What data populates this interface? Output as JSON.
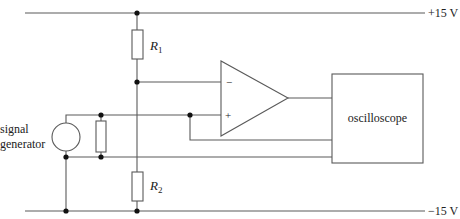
{
  "diagram": {
    "type": "circuit-schematic",
    "rails": {
      "positive": "+15 V",
      "negative": "−15 V"
    },
    "components": {
      "r1": {
        "symbol": "R",
        "subscript": "1"
      },
      "r2": {
        "symbol": "R",
        "subscript": "2"
      },
      "op_amp": {
        "inverting": "−",
        "non_inverting": "+"
      },
      "oscilloscope": {
        "label": "oscilloscope"
      },
      "signal_generator": {
        "line1": "signal",
        "line2": "generator"
      }
    },
    "colors": {
      "wire": "#5a5a5a",
      "junction": "#111111",
      "text": "#222222"
    }
  }
}
